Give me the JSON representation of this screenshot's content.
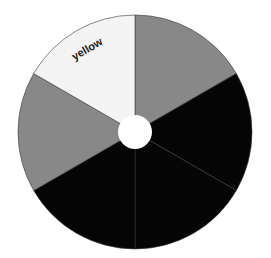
{
  "chart_data": {
    "type": "pie",
    "variant": "donut",
    "title": "",
    "categories": [
      "",
      "",
      "",
      "",
      "",
      "yellow"
    ],
    "values": [
      1,
      1,
      1,
      1,
      1,
      1
    ],
    "colors": [
      "#888888",
      "#050505",
      "#050505",
      "#050505",
      "#888888",
      "#f4f4f4"
    ],
    "labels_shown": [
      "",
      "",
      "",
      "",
      "",
      "yellow"
    ],
    "start_angle_deg": 0,
    "direction": "clockwise",
    "center": [
      135,
      132
    ],
    "outer_radius": 117,
    "inner_radius": 17,
    "legend": "none"
  }
}
